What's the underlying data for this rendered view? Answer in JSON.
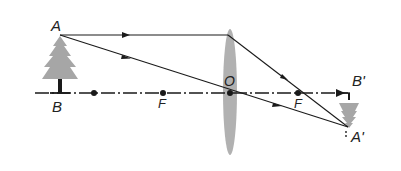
{
  "diagram": {
    "type": "convex-lens-ray-diagram",
    "colors": {
      "line": "#1a1a1a",
      "lens": "#a9a9a9",
      "object": "#a6a6a6",
      "image": "#a6a6a6",
      "label": "#222222"
    },
    "labels": {
      "object_top": "A",
      "object_base": "B",
      "focus_left": "F",
      "optical_center": "O",
      "focus_right": "F",
      "image_base": "B'",
      "image_top": "A'"
    },
    "points": {
      "A": [
        60,
        35
      ],
      "B": [
        60,
        93
      ],
      "two_f_left": [
        94,
        93
      ],
      "F_left": [
        163,
        93
      ],
      "O": [
        230,
        93
      ],
      "F_right": [
        298,
        93
      ],
      "B_prime": [
        350,
        93
      ],
      "A_prime": [
        348,
        127
      ],
      "axis_end": [
        340,
        93
      ]
    },
    "rays": [
      {
        "name": "parallel-ray",
        "path": [
          [
            60,
            35
          ],
          [
            228,
            35
          ],
          [
            348,
            127
          ]
        ]
      },
      {
        "name": "central-ray",
        "path": [
          [
            60,
            35
          ],
          [
            230,
            93
          ],
          [
            348,
            127
          ]
        ]
      }
    ]
  }
}
